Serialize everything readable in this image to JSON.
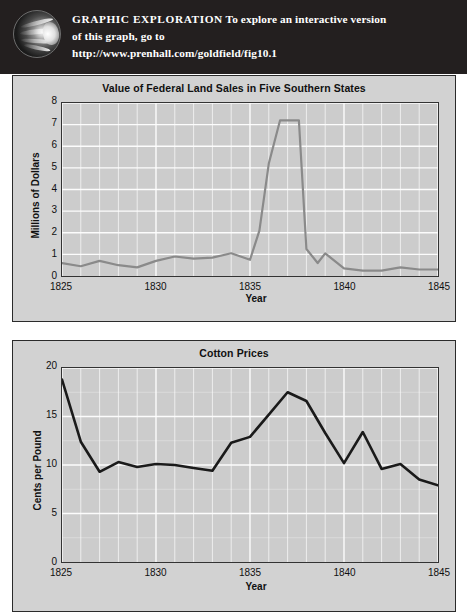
{
  "header": {
    "icon": "globe-hand-icon",
    "lead": "GRAPHIC  EXPLORATION",
    "line1_rest": "  To explore an interactive version",
    "line2": "of this graph, go to",
    "line3": "http://www.prenhall.com/goldfield/fig10.1",
    "background_color": "#231f1f",
    "text_color": "#ffffff"
  },
  "colors": {
    "panel_background": "#d2d2d2",
    "plot_background": "#cccccc",
    "gridline": "#ffffff",
    "axis": "#333333",
    "land_sales_line": "#8a8a8a",
    "cotton_line": "#1a1a1a"
  },
  "chart_data": [
    {
      "id": "land-sales",
      "type": "line",
      "title": "Value of Federal Land Sales in Five Southern States",
      "xlabel": "Year",
      "ylabel": "Millions of Dollars",
      "xlim": [
        1825,
        1845
      ],
      "ylim": [
        0,
        8
      ],
      "xticks": [
        1825,
        1830,
        1835,
        1840,
        1845
      ],
      "yticks": [
        0,
        1,
        2,
        3,
        4,
        5,
        6,
        7,
        8
      ],
      "grid": true,
      "legend": "none",
      "line_color": "#8a8a8a",
      "x": [
        1825,
        1826,
        1827,
        1828,
        1829,
        1830,
        1831,
        1832,
        1833,
        1834,
        1835,
        1836,
        1837,
        1838,
        1839,
        1840,
        1841,
        1842,
        1843,
        1844,
        1845
      ],
      "values": [
        0.6,
        0.45,
        0.7,
        0.5,
        0.4,
        0.7,
        0.9,
        0.8,
        0.85,
        1.05,
        0.75,
        2.1,
        5.2,
        7.2,
        7.2,
        1.25,
        0.6,
        1.05,
        0.35,
        0.25,
        0.3
      ]
    },
    {
      "id": "cotton-prices",
      "type": "line",
      "title": "Cotton Prices",
      "xlabel": "Year",
      "ylabel": "Cents per Pound",
      "xlim": [
        1825,
        1845
      ],
      "ylim": [
        0,
        20
      ],
      "xticks": [
        1825,
        1830,
        1835,
        1840,
        1845
      ],
      "yticks": [
        0,
        5,
        10,
        15,
        20
      ],
      "grid": true,
      "legend": "none",
      "line_color": "#1a1a1a",
      "x": [
        1825,
        1826,
        1827,
        1828,
        1829,
        1830,
        1831,
        1832,
        1833,
        1834,
        1835,
        1836,
        1837,
        1838,
        1839,
        1840,
        1841,
        1842,
        1843,
        1844,
        1845
      ],
      "values": [
        18.8,
        12.4,
        9.3,
        10.3,
        9.8,
        10.1,
        10.0,
        9.7,
        9.4,
        12.3,
        12.9,
        15.2,
        17.5,
        16.6,
        13.3,
        10.2,
        13.4,
        9.6,
        10.1,
        8.5,
        7.9
      ]
    }
  ],
  "land_sales_plot_points": [
    [
      1825,
      0.6
    ],
    [
      1826,
      0.45
    ],
    [
      1827,
      0.7
    ],
    [
      1828,
      0.5
    ],
    [
      1829,
      0.4
    ],
    [
      1830,
      0.7
    ],
    [
      1831,
      0.9
    ],
    [
      1832,
      0.8
    ],
    [
      1833,
      0.85
    ],
    [
      1834,
      1.05
    ],
    [
      1835,
      0.75
    ],
    [
      1835.5,
      2.1
    ],
    [
      1836,
      5.2
    ],
    [
      1836.6,
      7.2
    ],
    [
      1837.6,
      7.2
    ],
    [
      1838,
      1.25
    ],
    [
      1838.6,
      0.6
    ],
    [
      1839,
      1.05
    ],
    [
      1840,
      0.35
    ],
    [
      1841,
      0.25
    ],
    [
      1842,
      0.25
    ],
    [
      1843,
      0.4
    ],
    [
      1844,
      0.3
    ],
    [
      1845,
      0.3
    ]
  ],
  "cotton_plot_points": [
    [
      1825,
      18.8
    ],
    [
      1826,
      12.4
    ],
    [
      1827,
      9.3
    ],
    [
      1828,
      10.3
    ],
    [
      1829,
      9.8
    ],
    [
      1830,
      10.1
    ],
    [
      1831,
      10.0
    ],
    [
      1832,
      9.7
    ],
    [
      1833,
      9.4
    ],
    [
      1834,
      12.3
    ],
    [
      1835,
      12.9
    ],
    [
      1836,
      15.2
    ],
    [
      1837,
      17.5
    ],
    [
      1838,
      16.6
    ],
    [
      1839,
      13.3
    ],
    [
      1840,
      10.2
    ],
    [
      1841,
      13.4
    ],
    [
      1842,
      9.6
    ],
    [
      1843,
      10.1
    ],
    [
      1844,
      8.5
    ],
    [
      1845,
      7.9
    ]
  ]
}
